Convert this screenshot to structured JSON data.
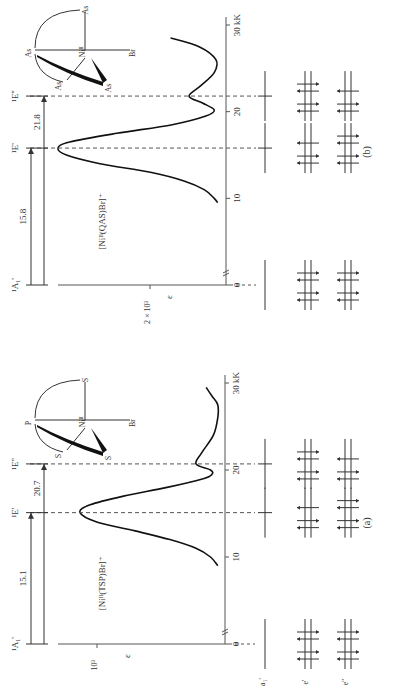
{
  "figure": {
    "orientation": "rotated 90 degrees counter-clockwise",
    "panels": [
      {
        "id": "b",
        "caption": "(b)",
        "complex": "[Niᴵᴵ(QAS)Br]⁺",
        "ligand_atoms": [
          "As",
          "As",
          "As",
          "As",
          "Br"
        ],
        "metal": "Niᴵᴵ",
        "states": [
          "¹A₁'",
          "¹E'",
          "¹E''"
        ],
        "transitions": [
          {
            "from": "¹A₁'",
            "to": "¹E'",
            "energy_label": "15.8"
          },
          {
            "from": "¹A₁'",
            "to": "¹E''",
            "energy_label": "21.8"
          }
        ],
        "y_axis_label": "ε",
        "y_tick_label": "2 × 10³",
        "x_ticks": [
          "0",
          "10",
          "20",
          "30 kK"
        ],
        "spectrum_kK": [
          9.5,
          10,
          11,
          12,
          13,
          14,
          15,
          15.8,
          16.5,
          17.5,
          18.5,
          19.5,
          20.2,
          21,
          21.8,
          23,
          24.5,
          26,
          27.5,
          28.5
        ],
        "spectrum_eps_rel": [
          0.05,
          0.07,
          0.13,
          0.25,
          0.45,
          0.75,
          0.95,
          1.0,
          0.93,
          0.65,
          0.32,
          0.12,
          0.07,
          0.14,
          0.22,
          0.15,
          0.07,
          0.06,
          0.16,
          0.33
        ]
      },
      {
        "id": "a",
        "caption": "(a)",
        "complex": "[Niᴵᴵ(TSP)Br]⁺",
        "ligand_atoms": [
          "P",
          "S",
          "S",
          "S",
          "Br"
        ],
        "metal": "Niᴵᴵ",
        "states": [
          "¹A₁'",
          "¹E'",
          "¹E''"
        ],
        "transitions": [
          {
            "from": "¹A₁'",
            "to": "¹E'",
            "energy_label": "15.1"
          },
          {
            "from": "¹A₁'",
            "to": "¹E''",
            "energy_label": "20.7"
          }
        ],
        "y_axis_label": "ε",
        "y_tick_label": "10³",
        "x_ticks": [
          "0",
          "10",
          "20",
          "30 kK"
        ],
        "spectrum_kK": [
          9,
          10,
          11,
          12,
          13,
          14,
          15.1,
          16,
          17,
          18,
          19,
          19.5,
          20,
          20.7,
          22,
          24,
          26,
          27.5,
          28.5,
          29.5
        ],
        "spectrum_eps_rel": [
          0.05,
          0.1,
          0.2,
          0.38,
          0.62,
          0.88,
          1.0,
          0.93,
          0.7,
          0.4,
          0.15,
          0.09,
          0.1,
          0.2,
          0.16,
          0.08,
          0.05,
          0.05,
          0.09,
          0.13
        ]
      }
    ],
    "orbital_labels": [
      "a₁'",
      "e'",
      "e''"
    ]
  }
}
